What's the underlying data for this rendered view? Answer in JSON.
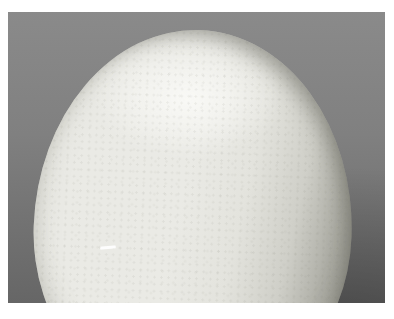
{
  "scene": {
    "subject": "close-up photograph of a white egg",
    "background": "gray studio backdrop, darker toward bottom corners",
    "frame": "white photo border",
    "details": [
      "specular highlight on upper shell",
      "shadowed right side with dark rim",
      "speckled shell texture",
      "small white scratch mark lower-left"
    ]
  },
  "colors": {
    "page-bg": "#ffffff",
    "bg-top": "#8a8a8a",
    "bg-bottom-left": "#666666",
    "bg-bottom-right": "#575757",
    "egg-base": "#eaeae5",
    "egg-highlight": "#f9f9f6",
    "egg-shadow": "#a9a9a1",
    "egg-rim-dark": "#6e6e66",
    "scratch": "#ffffff"
  }
}
